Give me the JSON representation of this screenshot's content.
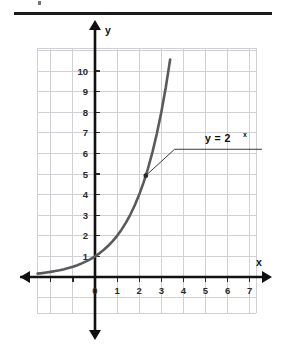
{
  "figure": {
    "title_rule": true,
    "colors": {
      "curve": "#5a5a5a",
      "axis": "#111111",
      "grid": "#cfcfd4",
      "text": "#1a1a1a",
      "rule": "#1a1a1a",
      "leader": "#3a3a3a",
      "background": "#ffffff"
    },
    "axis_labels": {
      "x": "x",
      "y": "y"
    },
    "annotation": {
      "name": "curve-equation-label",
      "base": "y = 2",
      "exponent": "x",
      "full": "y = 2^x",
      "leader_from_point": {
        "x": 2.3,
        "y": 4.9
      },
      "leader_elbow": {
        "x": 3.6,
        "y": 6.2
      }
    }
  },
  "chart_data": {
    "type": "line",
    "title": "",
    "subtitle": "",
    "xlabel": "x",
    "ylabel": "y",
    "function": "y = 2^x",
    "grid": true,
    "legend": "none",
    "annotations": [
      {
        "text": "y = 2^x",
        "x": 4.2,
        "y": 6.5,
        "points_to": {
          "x": 2.3,
          "y": 4.9
        }
      }
    ],
    "xlim": [
      -2.6,
      7.9
    ],
    "ylim": [
      -1.9,
      11.8
    ],
    "xticks": [
      0,
      1,
      2,
      3,
      4,
      5,
      6,
      7
    ],
    "xticklabels": [
      "0",
      "1",
      "2",
      "3",
      "4",
      "5",
      "6",
      "7"
    ],
    "yticks": [
      0,
      1,
      2,
      3,
      4,
      5,
      6,
      7,
      8,
      9,
      10
    ],
    "yticklabels": [
      "0",
      "1",
      "2",
      "3",
      "4",
      "5",
      "6",
      "7",
      "8",
      "9",
      "10"
    ],
    "series": [
      {
        "name": "y = 2^x",
        "color": "#5a5a5a",
        "x": [
          -2.6,
          -2.4,
          -2.2,
          -2.0,
          -1.8,
          -1.6,
          -1.4,
          -1.2,
          -1.0,
          -0.8,
          -0.6,
          -0.4,
          -0.2,
          0.0,
          0.2,
          0.4,
          0.6,
          0.8,
          1.0,
          1.2,
          1.4,
          1.6,
          1.8,
          2.0,
          2.2,
          2.4,
          2.6,
          2.8,
          3.0,
          3.2,
          3.4,
          3.5
        ],
        "y": [
          0.165,
          0.189,
          0.218,
          0.25,
          0.287,
          0.33,
          0.379,
          0.435,
          0.5,
          0.574,
          0.66,
          0.758,
          0.871,
          1.0,
          1.149,
          1.32,
          1.516,
          1.741,
          2.0,
          2.297,
          2.639,
          3.031,
          3.482,
          4.0,
          4.595,
          5.278,
          6.063,
          6.964,
          8.0,
          9.19,
          10.556,
          11.314
        ]
      }
    ],
    "marked_point": {
      "x": 2.3,
      "y": 4.92
    }
  }
}
